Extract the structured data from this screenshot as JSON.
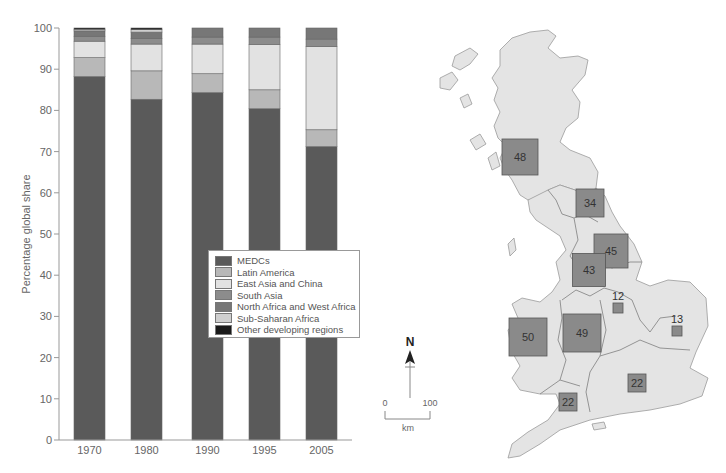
{
  "chart_data": [
    {
      "type": "bar",
      "stacked": true,
      "title": "",
      "xlabel": "",
      "ylabel": "Percentage global share",
      "ylim": [
        0,
        100
      ],
      "yticks": [
        0,
        10,
        20,
        30,
        40,
        50,
        60,
        70,
        80,
        90,
        100
      ],
      "grid": false,
      "legend_position": "inside, lower-right of chart area",
      "categories": [
        "1970",
        "1980",
        "1990",
        "1995",
        "2005"
      ],
      "series": [
        {
          "name": "MEDCs",
          "color": "#5a5a5a",
          "values": [
            88.2,
            82.7,
            84.3,
            80.4,
            71.2
          ]
        },
        {
          "name": "Latin America",
          "color": "#b8b8b8",
          "values": [
            4.6,
            6.9,
            4.6,
            4.6,
            4.1
          ]
        },
        {
          "name": "East Asia and China",
          "color": "#e2e2e2",
          "values": [
            4.0,
            6.5,
            7.2,
            11.0,
            20.2
          ]
        },
        {
          "name": "South Asia",
          "color": "#8c8c8c",
          "values": [
            1.2,
            1.4,
            1.7,
            1.8,
            1.8
          ]
        },
        {
          "name": "North Africa and West Africa",
          "color": "#777777",
          "values": [
            1.3,
            1.5,
            2.2,
            2.2,
            2.7
          ]
        },
        {
          "name": "Sub-Saharan Africa",
          "color": "#cfcfcf",
          "values": [
            0.4,
            0.6,
            0.0,
            0.0,
            0.0
          ]
        },
        {
          "name": "Other developing regions",
          "color": "#1a1a1a",
          "values": [
            0.3,
            0.4,
            0.0,
            0.0,
            0.0
          ]
        }
      ]
    },
    {
      "type": "map",
      "title": "",
      "description": "Proportional squares on map of Great Britain regions",
      "regions": [
        {
          "label": "48",
          "value": 48,
          "x": 520,
          "y": 157,
          "size": 36
        },
        {
          "label": "34",
          "value": 34,
          "x": 590,
          "y": 203,
          "size": 28
        },
        {
          "label": "45",
          "value": 45,
          "x": 611,
          "y": 251,
          "size": 34
        },
        {
          "label": "43",
          "value": 43,
          "x": 589,
          "y": 270,
          "size": 33
        },
        {
          "label": "12",
          "value": 12,
          "x": 618,
          "y": 308,
          "size": 10
        },
        {
          "label": "13",
          "value": 13,
          "x": 677,
          "y": 331,
          "size": 10
        },
        {
          "label": "50",
          "value": 50,
          "x": 528,
          "y": 337,
          "size": 38
        },
        {
          "label": "49",
          "value": 49,
          "x": 582,
          "y": 333,
          "size": 38
        },
        {
          "label": "22",
          "value": 22,
          "x": 637,
          "y": 383,
          "size": 18
        },
        {
          "label": "22",
          "value": 22,
          "x": 568,
          "y": 402,
          "size": 18
        }
      ],
      "north_arrow": "N",
      "scale": {
        "min": "0",
        "max": "100",
        "unit": "km"
      }
    }
  ],
  "legend": {
    "items": [
      {
        "label": "MEDCs",
        "color": "#5a5a5a"
      },
      {
        "label": "Latin America",
        "color": "#b8b8b8"
      },
      {
        "label": "East Asia and China",
        "color": "#e2e2e2"
      },
      {
        "label": "South Asia",
        "color": "#8c8c8c"
      },
      {
        "label": "North Africa and West Africa",
        "color": "#777777"
      },
      {
        "label": "Sub-Saharan Africa",
        "color": "#cfcfcf"
      },
      {
        "label": "Other developing regions",
        "color": "#1a1a1a"
      }
    ]
  },
  "axis": {
    "ylabel": "Percentage global share",
    "yticks": [
      "0",
      "10",
      "20",
      "30",
      "40",
      "50",
      "60",
      "70",
      "80",
      "90",
      "100"
    ],
    "xticks": [
      "1970",
      "1980",
      "1990",
      "1995",
      "2005"
    ]
  },
  "map": {
    "north_label": "N",
    "scale_min": "0",
    "scale_max": "100",
    "scale_unit": "km",
    "land_color": "#e4e4e4",
    "box_color": "#8a8a8a"
  }
}
